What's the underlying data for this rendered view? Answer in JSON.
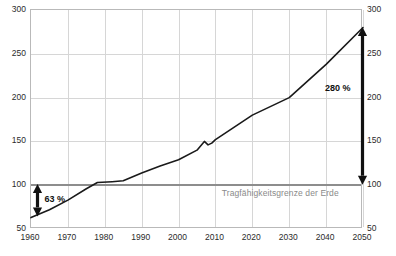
{
  "chart_data": {
    "type": "line",
    "title": "",
    "xlabel": "",
    "ylabel": "",
    "xlim": [
      1960,
      2050
    ],
    "ylim": [
      50,
      300
    ],
    "grid": true,
    "legend": "none",
    "x_ticks": [
      1960,
      1970,
      1980,
      1990,
      2000,
      2010,
      2020,
      2030,
      2040,
      2050
    ],
    "y_ticks": [
      50,
      100,
      150,
      200,
      250,
      300
    ],
    "y_axis_duplicated_right": true,
    "series": [
      {
        "name": "Ökologischer Fußabdruck",
        "color": "#1a1a1a",
        "x": [
          1960,
          1965,
          1970,
          1975,
          1978,
          1982,
          1985,
          1990,
          1995,
          2000,
          2005,
          2007,
          2008,
          2009,
          2010,
          2015,
          2020,
          2030,
          2040,
          2050
        ],
        "values": [
          63,
          72,
          83,
          96,
          103,
          104,
          105,
          114,
          122,
          129,
          140,
          150,
          146,
          148,
          152,
          166,
          180,
          200,
          238,
          280
        ]
      }
    ],
    "reference_lines": [
      {
        "name": "carrying-capacity",
        "value": 100,
        "label": "Tragfähigkeitsgrenze der Erde",
        "color": "#8d8d8d"
      }
    ],
    "annotations": [
      {
        "name": "deficit-1960",
        "label": "63 %",
        "x": 1962,
        "from": 63,
        "to": 100,
        "style": "double-arrow"
      },
      {
        "name": "overshoot-2050",
        "label": "280 %",
        "x": 2050,
        "from": 100,
        "to": 280,
        "style": "double-arrow"
      }
    ]
  },
  "axis": {
    "x_labels": [
      "1960",
      "1970",
      "1980",
      "1990",
      "2000",
      "2010",
      "2020",
      "2030",
      "2040",
      "2050"
    ],
    "y_labels": [
      "50",
      "100",
      "150",
      "200",
      "250",
      "300"
    ]
  },
  "labels": {
    "capacity": "Tragfähigkeitsgrenze der Erde",
    "annot_left": "63 %",
    "annot_right": "280 %"
  },
  "colors": {
    "curve": "#1a1a1a",
    "grid": "#d6d6d6",
    "frame": "#b9b9b9",
    "capacity": "#8d8d8d",
    "text": "#2b2b2b",
    "capacity_text": "#8a8a8a"
  }
}
